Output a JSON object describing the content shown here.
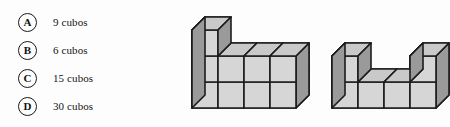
{
  "question": {
    "options": [
      {
        "letter": "A",
        "text": "9 cubos"
      },
      {
        "letter": "B",
        "text": "6 cubos"
      },
      {
        "letter": "C",
        "text": "15 cubos"
      },
      {
        "letter": "D",
        "text": "30 cubos"
      }
    ]
  },
  "figures": {
    "left": {
      "name": "L-shaped stepped cube solid",
      "columns": [
        3,
        2,
        2,
        2
      ],
      "depth": 2,
      "visible_cube_count": 9
    },
    "right": {
      "name": "U-shaped cube solid",
      "columns": [
        2,
        1,
        1,
        2
      ],
      "depth": 2,
      "visible_cube_count": 6
    }
  },
  "colors": {
    "top_face": "#c9c9c9",
    "front_face": "#d6d6d6",
    "side_face": "#9a9a9a",
    "outline": "#1c1c1c",
    "background": "#fdfdfd",
    "text": "#141414"
  },
  "geometry": {
    "cube_width": 26,
    "cube_height": 26,
    "depth_dx": 13,
    "depth_dy": -13
  }
}
